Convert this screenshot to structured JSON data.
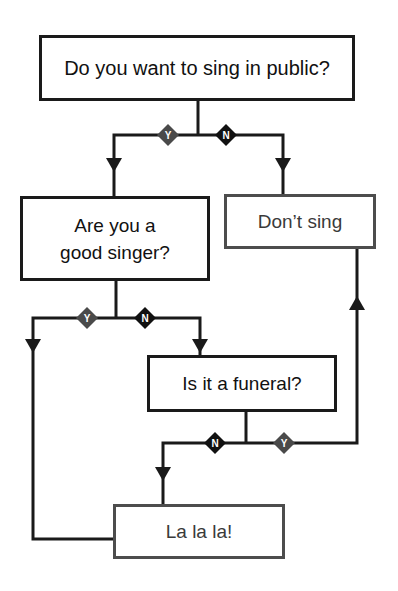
{
  "flowchart": {
    "nodes": {
      "q_public": {
        "label": "Do you want to sing in public?",
        "type": "question"
      },
      "q_good": {
        "label_line1": "Are you a",
        "label_line2": "good singer?",
        "type": "question"
      },
      "o_dont": {
        "label": "Don’t sing",
        "type": "outcome"
      },
      "q_funeral": {
        "label": "Is it a funeral?",
        "type": "question"
      },
      "o_lalala": {
        "label": "La la la!",
        "type": "outcome"
      }
    },
    "branches": [
      {
        "from": "q_public",
        "label": "Y",
        "to": "q_good"
      },
      {
        "from": "q_public",
        "label": "N",
        "to": "o_dont"
      },
      {
        "from": "q_good",
        "label": "Y",
        "to": "o_lalala"
      },
      {
        "from": "q_good",
        "label": "N",
        "to": "q_funeral"
      },
      {
        "from": "q_funeral",
        "label": "N",
        "to": "o_lalala"
      },
      {
        "from": "q_funeral",
        "label": "Y",
        "to": "o_dont"
      }
    ],
    "branch_labels": {
      "yes": "Y",
      "no": "N"
    },
    "colors": {
      "line": "#1a1a1a",
      "yes_diamond": "#4a4a4a",
      "no_diamond": "#111111",
      "question_border": "#1a1a1a",
      "outcome_border": "#4d4d4d"
    }
  }
}
